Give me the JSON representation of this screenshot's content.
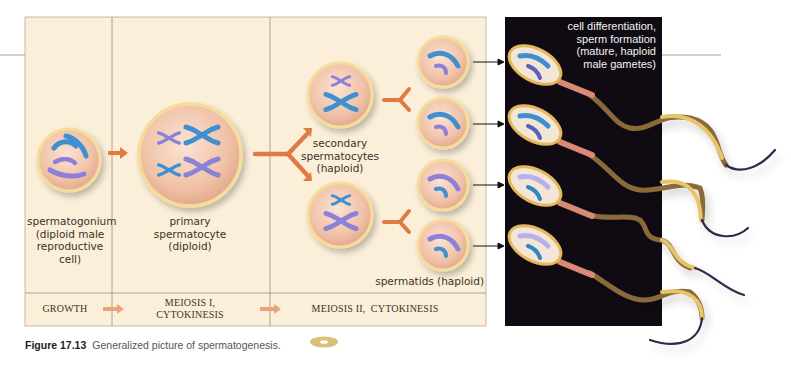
{
  "figure": {
    "number": "Figure 17.13",
    "caption": "Generalized picture of spermatogenesis.",
    "caption_icon": "cd-disc-icon"
  },
  "stages": [
    {
      "id": "spermatogonium",
      "label_lines": [
        "spermatogonium",
        "(diploid male",
        "reproductive",
        "cell)"
      ]
    },
    {
      "id": "primary",
      "label_lines": [
        "primary",
        "spermatocyte",
        "(diploid)"
      ]
    },
    {
      "id": "secondary",
      "label_lines": [
        "secondary",
        "spermatocytes",
        "(haploid)"
      ]
    },
    {
      "id": "spermatids",
      "label_lines": [
        "spermatids (haploid)"
      ]
    },
    {
      "id": "sperm",
      "label_lines": [
        "cell differentiation,",
        "sperm formation",
        "(mature, haploid",
        "male gametes)"
      ]
    }
  ],
  "phases": [
    {
      "label_lines": [
        "GROWTH"
      ]
    },
    {
      "label_lines": [
        "MEIOSIS I,",
        "CYTOKINESIS"
      ]
    },
    {
      "label_lines": [
        "MEIOSIS II,  CYTOKINESIS"
      ]
    }
  ],
  "colors": {
    "panel_bg": "#fbefd9",
    "panel_border": "#b9ab95",
    "dark_panel": "#100b12",
    "arrow_orange": "#e07a45",
    "chromosome_blue": "#3f8fd0",
    "chromosome_violet": "#8c80d8",
    "cell_fill": "#f1c6ad",
    "cell_rim": "#f6dc9a",
    "tail_gold": "#e8c46a",
    "tail_dark": "#2d2a4a"
  }
}
